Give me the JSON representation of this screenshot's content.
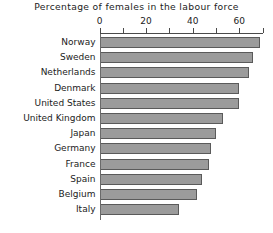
{
  "chart_data": {
    "type": "bar",
    "orientation": "horizontal",
    "title": "Percentage of females in the labour force",
    "xlabel": "",
    "ylabel": "",
    "xlim": [
      0,
      70
    ],
    "grid": false,
    "legend": null,
    "major_ticks": [
      0,
      20,
      40,
      60
    ],
    "minor_ticks": [
      10,
      30,
      50,
      70
    ],
    "tick_labels": [
      "0",
      "20",
      "40",
      "60"
    ],
    "categories": [
      "Norway",
      "Sweden",
      "Netherlands",
      "Denmark",
      "United States",
      "United Kingdom",
      "Japan",
      "Germany",
      "France",
      "Spain",
      "Belgium",
      "Italy"
    ],
    "values": [
      69,
      66,
      64,
      60,
      60,
      53,
      50,
      48,
      47,
      44,
      42,
      34
    ]
  },
  "style": {
    "bar_fill": "#9b9b9b",
    "bar_stroke": "#5a5a5a",
    "axis_color": "#4a4a4a",
    "text_color": "#1c1c1c",
    "background": "#ffffff"
  }
}
